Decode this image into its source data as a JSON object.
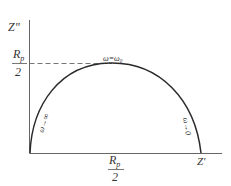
{
  "diagram": {
    "type": "nyquist-semicircle",
    "y_axis_label": "Z\"",
    "x_axis_label": "Z'",
    "y_marker": {
      "numerator": "R",
      "subscript": "p",
      "denominator": "2"
    },
    "x_marker": {
      "numerator": "R",
      "subscript": "p",
      "denominator": "2"
    },
    "annotations": {
      "peak": "ω=ω₀",
      "left_branch": "ω→∞",
      "right_branch": "ω→0"
    },
    "colors": {
      "line": "#2a2a2a",
      "axis": "#555555",
      "text": "#333333"
    }
  }
}
